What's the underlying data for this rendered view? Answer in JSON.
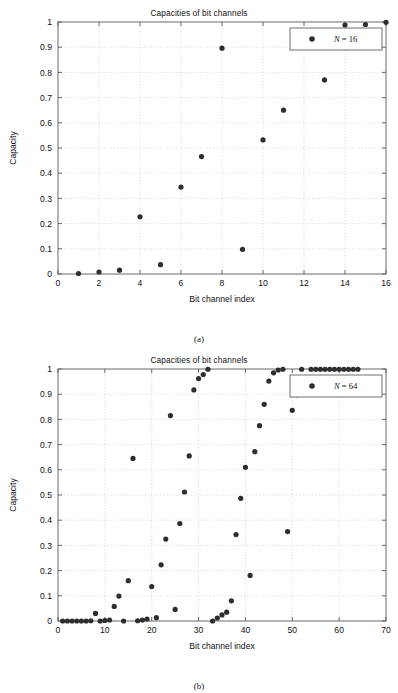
{
  "figures": [
    {
      "caption": "(a)",
      "title": "Capacities of bit channels",
      "legend_label": "N = 16",
      "legend_var": "N",
      "legend_rest": "= 16"
    },
    {
      "caption": "(b)",
      "title": "Capacities of bit channels",
      "legend_label": "N = 64",
      "legend_var": "N",
      "legend_rest": "= 64"
    }
  ],
  "axes": {
    "xlabel": "Bit channel index",
    "ylabel": "Capacity",
    "y_ticks": [
      "0",
      "0.1",
      "0.2",
      "0.3",
      "0.4",
      "0.5",
      "0.6",
      "0.7",
      "0.8",
      "0.9",
      "1"
    ],
    "x_ticks_a": [
      "0",
      "2",
      "4",
      "6",
      "8",
      "10",
      "12",
      "14",
      "16"
    ],
    "x_ticks_b": [
      "0",
      "10",
      "20",
      "30",
      "40",
      "50",
      "60",
      "70"
    ]
  },
  "colors": {
    "marker": "#2e2e2e",
    "frame": "#595959",
    "grid": "#b9b9b9",
    "background": "#ffffff"
  },
  "chart_data": [
    {
      "type": "scatter",
      "title": "Capacities of bit channels",
      "xlabel": "Bit channel index",
      "ylabel": "Capacity",
      "xlim": [
        0,
        16
      ],
      "ylim": [
        0,
        1
      ],
      "grid": true,
      "legend_position": "top-right",
      "series": [
        {
          "name": "N = 16",
          "x": [
            1,
            2,
            3,
            4,
            5,
            6,
            7,
            8,
            9,
            10,
            11,
            12,
            13,
            14,
            15,
            16
          ],
          "y": [
            0.002,
            0.008,
            0.015,
            0.227,
            0.037,
            0.345,
            0.466,
            0.896,
            0.098,
            0.532,
            0.65,
            0.96,
            0.77,
            0.988,
            0.99,
            0.999
          ]
        }
      ]
    },
    {
      "type": "scatter",
      "title": "Capacities of bit channels",
      "xlabel": "Bit channel index",
      "ylabel": "Capacity",
      "xlim": [
        0,
        70
      ],
      "ylim": [
        0,
        1
      ],
      "grid": true,
      "legend_position": "top-right",
      "series": [
        {
          "name": "N = 64",
          "x": [
            1,
            2,
            3,
            4,
            5,
            6,
            7,
            8,
            9,
            10,
            11,
            12,
            13,
            14,
            15,
            16,
            17,
            18,
            19,
            20,
            21,
            22,
            23,
            24,
            25,
            26,
            27,
            28,
            29,
            30,
            31,
            32,
            33,
            34,
            35,
            36,
            37,
            38,
            39,
            40,
            41,
            42,
            43,
            44,
            45,
            46,
            47,
            48,
            49,
            50,
            51,
            52,
            53,
            54,
            55,
            56,
            57,
            58,
            59,
            60,
            61,
            62,
            63,
            64
          ],
          "y": [
            0.0,
            0.0,
            0.0,
            0.0,
            0.0,
            0.0,
            0.001,
            0.03,
            0.0,
            0.002,
            0.004,
            0.058,
            0.099,
            0.0,
            0.16,
            0.645,
            0.001,
            0.004,
            0.008,
            0.137,
            0.013,
            0.223,
            0.325,
            0.815,
            0.046,
            0.387,
            0.512,
            0.655,
            0.917,
            0.962,
            0.978,
            0.999,
            0.0,
            0.012,
            0.024,
            0.035,
            0.08,
            0.343,
            0.487,
            0.61,
            0.181,
            0.672,
            0.775,
            0.86,
            0.952,
            0.985,
            0.996,
            0.999,
            0.355,
            0.836,
            0.898,
            0.999,
            0.943,
            0.999,
            0.999,
            0.999,
            0.999,
            0.999,
            0.999,
            0.999,
            0.999,
            0.999,
            0.999,
            0.999
          ]
        }
      ]
    }
  ]
}
